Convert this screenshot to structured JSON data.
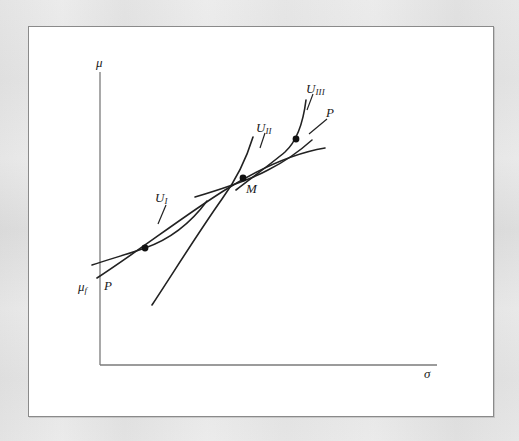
{
  "figure": {
    "kind": "economics-diagram",
    "background_color": "#ffffff",
    "outer_background_color": "#f3f3f3",
    "frame_border_color": "#8a8a8a",
    "line_color": "#222222",
    "axis_color": "#7a7a7a",
    "point_color": "#111111"
  },
  "axes": {
    "y_label": "μ",
    "x_label": "σ",
    "y_axis_top": {
      "x": 100,
      "y": 72
    },
    "y_axis_bottom": {
      "x": 100,
      "y": 365
    },
    "x_axis_left": {
      "x": 100,
      "y": 365
    },
    "x_axis_right": {
      "x": 437,
      "y": 365
    },
    "y_label_pos": {
      "x": 96,
      "y": 57
    },
    "x_label_pos": {
      "x": 424,
      "y": 372
    }
  },
  "markers": {
    "mu_f": {
      "label": "μ",
      "sub": "f",
      "pos": {
        "x": 79,
        "y": 280
      },
      "value_y": 288
    }
  },
  "curves": [
    {
      "name": "indifference-curve-1",
      "label": "U",
      "sub": "I",
      "label_pos": {
        "x": 157,
        "y": 191
      },
      "leader": {
        "x1": 166,
        "y1": 205,
        "x2": 158,
        "y2": 224
      },
      "path": "M 92,265 C 110,259 128,254 145,248 C 168,240 190,224 207,201"
    },
    {
      "name": "indifference-curve-2",
      "label": "U",
      "sub": "II",
      "label_pos": {
        "x": 258,
        "y": 121
      },
      "leader": {
        "x1": 265,
        "y1": 133,
        "x2": 260,
        "y2": 148
      },
      "path": "M 152,305 C 175,270 200,230 222,199 C 236,180 246,160 253,137"
    },
    {
      "name": "indifference-curve-3",
      "label": "U",
      "sub": "III",
      "label_pos": {
        "x": 308,
        "y": 82
      },
      "leader": {
        "x1": 313,
        "y1": 94,
        "x2": 307,
        "y2": 110
      },
      "path": "M 236,190 C 254,176 272,163 285,152 C 296,142 303,124 306,100"
    },
    {
      "name": "opportunity-locus-P",
      "label": "P",
      "label_pos": {
        "x": 104,
        "y": 279
      },
      "path": "M 97,278 C 140,250 185,215 225,190 C 262,167 295,153 325,148"
    },
    {
      "name": "capital-market-line-P",
      "label": "P",
      "label_pos": {
        "x": 327,
        "y": 106
      },
      "leader": {
        "x1": 327,
        "y1": 119,
        "x2": 311,
        "y2": 133
      },
      "path": "M 195,197 C 225,188 250,180 268,170 C 288,160 302,149 312,140"
    }
  ],
  "points": [
    {
      "name": "tangency-point-1",
      "x": 145,
      "y": 248,
      "label": ""
    },
    {
      "name": "tangency-point-M",
      "x": 243,
      "y": 178,
      "label": "M",
      "label_pos": {
        "x": 246,
        "y": 182
      }
    },
    {
      "name": "tangency-point-3",
      "x": 296,
      "y": 139,
      "label": ""
    }
  ],
  "point_labels": {
    "M": "M"
  }
}
